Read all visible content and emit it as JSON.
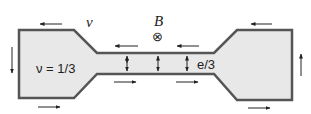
{
  "diagram": {
    "labels": {
      "velocity": "v",
      "field": "B",
      "field_symbol": "⊗",
      "filling": "ν = 1/3",
      "charge": "e/3"
    },
    "colors": {
      "fill": "#e8e8e8",
      "outline": "#555555",
      "arrow": "#222222"
    },
    "edge_arrows": [
      {
        "location": "left-pad-top",
        "direction": "left"
      },
      {
        "location": "left-pad-bottom",
        "direction": "right"
      },
      {
        "location": "left-pad-side",
        "direction": "down"
      },
      {
        "location": "right-pad-top",
        "direction": "left"
      },
      {
        "location": "right-pad-bottom",
        "direction": "right"
      },
      {
        "location": "right-pad-side",
        "direction": "up"
      },
      {
        "location": "channel-top-1",
        "direction": "left"
      },
      {
        "location": "channel-top-2",
        "direction": "left"
      },
      {
        "location": "channel-bottom-1",
        "direction": "right"
      },
      {
        "location": "channel-bottom-2",
        "direction": "right"
      }
    ],
    "tunneling_arrows": 3
  }
}
